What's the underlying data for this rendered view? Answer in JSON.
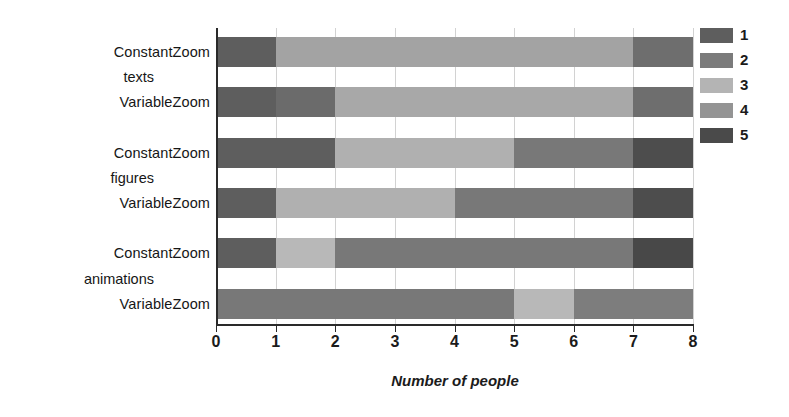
{
  "chart_data": {
    "type": "bar",
    "orientation": "horizontal",
    "stacked": true,
    "title": "",
    "xlabel": "Number of people",
    "ylabel": "",
    "xlim": [
      0,
      8
    ],
    "xticks": [
      0,
      1,
      2,
      3,
      4,
      5,
      6,
      7,
      8
    ],
    "xtick_labels": [
      "0",
      "1",
      "2",
      "3",
      "4",
      "5",
      "6",
      "7",
      "8"
    ],
    "grid": true,
    "grid_axis": "x",
    "legend": {
      "position": "top-right",
      "title": "",
      "entries": [
        {
          "label": "1",
          "color": "#5e5e5e"
        },
        {
          "label": "2",
          "color": "#7b7b7b"
        },
        {
          "label": "3",
          "color": "#b4b4b4"
        },
        {
          "label": "4",
          "color": "#949494"
        },
        {
          "label": "5",
          "color": "#4a4a4a"
        }
      ]
    },
    "groups": [
      {
        "label": "texts"
      },
      {
        "label": "figures"
      },
      {
        "label": "animations"
      }
    ],
    "categories": [
      "ConstantZoom",
      "VariableZoom",
      "ConstantZoom",
      "VariableZoom",
      "ConstantZoom",
      "VariableZoom"
    ],
    "series": [
      {
        "name": "1",
        "color": "#5e5e5e",
        "values": [
          1,
          1,
          2,
          1,
          1,
          0
        ]
      },
      {
        "name": "2",
        "color": "#7b7b7b",
        "values": [
          0,
          1,
          0,
          0,
          0,
          5
        ]
      },
      {
        "name": "3",
        "color": "#b4b4b4",
        "values": [
          0,
          0,
          3,
          3,
          1,
          1
        ]
      },
      {
        "name": "4",
        "color": "#949494",
        "values": [
          6,
          5,
          2,
          3,
          5,
          2
        ]
      },
      {
        "name": "5",
        "color": "#4a4a4a",
        "values": [
          1,
          1,
          1,
          1,
          1,
          0
        ]
      }
    ],
    "bars": [
      {
        "group": "texts",
        "category": "ConstantZoom",
        "segments": [
          {
            "series": "1",
            "start": 0,
            "end": 1,
            "value": 1,
            "color": "#5e5e5e"
          },
          {
            "series": "4",
            "start": 1,
            "end": 7,
            "value": 6,
            "color": "#a3a3a3"
          },
          {
            "series": "2",
            "start": 7,
            "end": 8,
            "value": 1,
            "color": "#6e6e6e"
          }
        ]
      },
      {
        "group": "texts",
        "category": "VariableZoom",
        "segments": [
          {
            "series": "1",
            "start": 0,
            "end": 1,
            "value": 1,
            "color": "#5e5e5e"
          },
          {
            "series": "2",
            "start": 1,
            "end": 2,
            "value": 1,
            "color": "#6b6b6b"
          },
          {
            "series": "4",
            "start": 2,
            "end": 7,
            "value": 5,
            "color": "#a8a8a8"
          },
          {
            "series": "2",
            "start": 7,
            "end": 8,
            "value": 1,
            "color": "#6e6e6e"
          }
        ]
      },
      {
        "group": "figures",
        "category": "ConstantZoom",
        "segments": [
          {
            "series": "1",
            "start": 0,
            "end": 2,
            "value": 2,
            "color": "#5e5e5e"
          },
          {
            "series": "3",
            "start": 2,
            "end": 5,
            "value": 3,
            "color": "#b0b0b0"
          },
          {
            "series": "2",
            "start": 5,
            "end": 7,
            "value": 2,
            "color": "#787878"
          },
          {
            "series": "5",
            "start": 7,
            "end": 8,
            "value": 1,
            "color": "#4d4d4d"
          }
        ]
      },
      {
        "group": "figures",
        "category": "VariableZoom",
        "segments": [
          {
            "series": "1",
            "start": 0,
            "end": 1,
            "value": 1,
            "color": "#5e5e5e"
          },
          {
            "series": "3",
            "start": 1,
            "end": 4,
            "value": 3,
            "color": "#b0b0b0"
          },
          {
            "series": "2",
            "start": 4,
            "end": 7,
            "value": 3,
            "color": "#787878"
          },
          {
            "series": "5",
            "start": 7,
            "end": 8,
            "value": 1,
            "color": "#4d4d4d"
          }
        ]
      },
      {
        "group": "animations",
        "category": "ConstantZoom",
        "segments": [
          {
            "series": "1",
            "start": 0,
            "end": 1,
            "value": 1,
            "color": "#5e5e5e"
          },
          {
            "series": "3",
            "start": 1,
            "end": 2,
            "value": 1,
            "color": "#b8b8b8"
          },
          {
            "series": "2",
            "start": 2,
            "end": 7,
            "value": 5,
            "color": "#787878"
          },
          {
            "series": "5",
            "start": 7,
            "end": 8,
            "value": 1,
            "color": "#484848"
          }
        ]
      },
      {
        "group": "animations",
        "category": "VariableZoom",
        "segments": [
          {
            "series": "2",
            "start": 0,
            "end": 5,
            "value": 5,
            "color": "#787878"
          },
          {
            "series": "3",
            "start": 5,
            "end": 6,
            "value": 1,
            "color": "#b8b8b8"
          },
          {
            "series": "2",
            "start": 6,
            "end": 8,
            "value": 2,
            "color": "#7d7d7d"
          }
        ]
      }
    ]
  },
  "axis": {
    "x_title": "Number of people"
  }
}
